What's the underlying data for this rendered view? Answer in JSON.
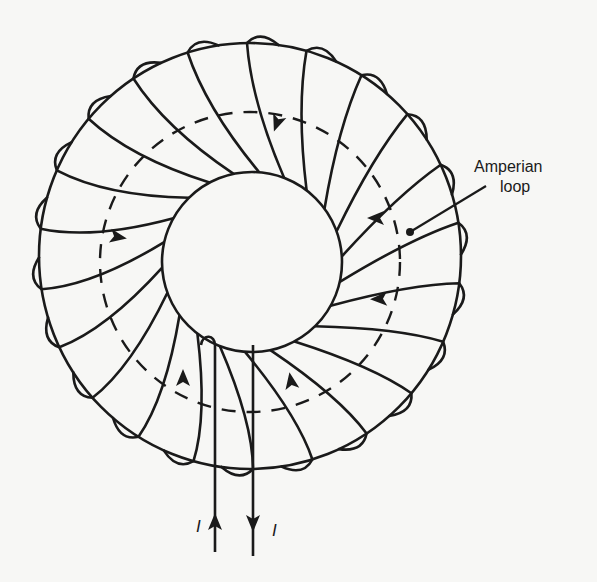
{
  "diagram": {
    "type": "toroid-winding",
    "colors": {
      "ink": "#1a1a1a",
      "background": "#f7f7f5"
    },
    "labels": {
      "amperian_line1": "Amperian",
      "amperian_line2": "loop",
      "current_left": "I",
      "current_right": "I"
    },
    "geometry": {
      "outer": {
        "cx": 250,
        "cy": 256,
        "rx": 211,
        "ry": 213
      },
      "inner": {
        "cx": 252,
        "cy": 262,
        "r": 90
      },
      "amperian": {
        "cx": 250,
        "cy": 262,
        "r": 150
      },
      "turns": 22
    },
    "arrows": [
      {
        "name": "turn-arrow-top",
        "x": 277,
        "y": 123,
        "angle": 110
      },
      {
        "name": "turn-arrow-left",
        "x": 118,
        "y": 237,
        "angle": 10
      },
      {
        "name": "turn-arrow-right-upper",
        "x": 376,
        "y": 218,
        "angle": 180
      },
      {
        "name": "turn-arrow-right-lower",
        "x": 379,
        "y": 299,
        "angle": 178
      },
      {
        "name": "turn-arrow-bottom-left",
        "x": 183,
        "y": 378,
        "angle": -90
      },
      {
        "name": "turn-arrow-bottom-right",
        "x": 291,
        "y": 381,
        "angle": -100
      },
      {
        "name": "lead-arrow-in",
        "x": 215,
        "y": 522,
        "angle": -90
      },
      {
        "name": "lead-arrow-out",
        "x": 253,
        "y": 523,
        "angle": 90
      }
    ]
  }
}
